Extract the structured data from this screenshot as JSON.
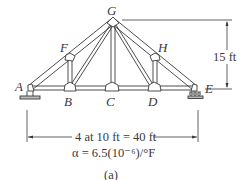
{
  "figure": {
    "caption": "(a)",
    "nodes": [
      {
        "id": "A",
        "label": "A"
      },
      {
        "id": "B",
        "label": "B"
      },
      {
        "id": "C",
        "label": "C"
      },
      {
        "id": "D",
        "label": "D"
      },
      {
        "id": "E",
        "label": "E"
      },
      {
        "id": "F",
        "label": "F"
      },
      {
        "id": "G",
        "label": "G"
      },
      {
        "id": "H",
        "label": "H"
      }
    ],
    "members": [
      "A-B",
      "B-C",
      "C-D",
      "D-E",
      "A-F",
      "F-G",
      "G-H",
      "H-E",
      "F-B",
      "B-G",
      "G-C",
      "G-D",
      "D-H"
    ],
    "supports": {
      "A": "pin",
      "E": "roller"
    },
    "dimensions": {
      "height": "15 ft",
      "span": "4 at 10 ft = 40 ft"
    },
    "coefficient": "α = 6.5(10⁻⁶)/°F"
  },
  "colors": {
    "ink": "#3a3a3a",
    "member_fill": "#f2f2f2"
  }
}
